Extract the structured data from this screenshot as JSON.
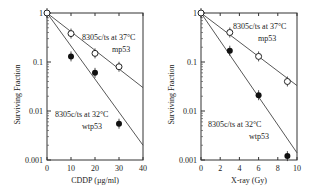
{
  "chart_data": [
    {
      "type": "scatter",
      "title": "",
      "xlabel": "CDDP (µg/ml)",
      "ylabel": "Surviving Fraction",
      "xlim": [
        0,
        40
      ],
      "ylim": [
        0.001,
        1
      ],
      "yscale": "log",
      "x_ticks": [
        "0",
        "10",
        "20",
        "30",
        "40"
      ],
      "y_ticks": [
        "1",
        "0.1",
        "0.01",
        "0.001"
      ],
      "grid": false,
      "annotations": [
        {
          "text": "8305c/ts at 37°C",
          "sub": "mp53"
        },
        {
          "text": "8305c/ts at 32°C",
          "sub": "wtp53"
        }
      ],
      "series": [
        {
          "name": "8305c/ts at 37°C mp53",
          "marker": "open-circle",
          "x": [
            0,
            10,
            20,
            30
          ],
          "y": [
            1,
            0.38,
            0.15,
            0.08
          ],
          "fit": [
            [
              0,
              1
            ],
            [
              40,
              0.03
            ]
          ]
        },
        {
          "name": "8305c/ts at 32°C wtp53",
          "marker": "filled-circle",
          "x": [
            10,
            20,
            30
          ],
          "y": [
            0.13,
            0.06,
            0.0055
          ],
          "fit": [
            [
              0,
              1
            ],
            [
              40,
              0.002
            ]
          ]
        }
      ]
    },
    {
      "type": "scatter",
      "title": "",
      "xlabel": "X-ray (Gy)",
      "ylabel": "Surviving Fraction",
      "xlim": [
        0,
        10
      ],
      "ylim": [
        0.001,
        1
      ],
      "yscale": "log",
      "x_ticks": [
        "0",
        "2",
        "4",
        "6",
        "8",
        "10"
      ],
      "y_ticks": [
        "1",
        "0.1",
        "0.01",
        "0.001"
      ],
      "grid": false,
      "annotations": [
        {
          "text": "8305c/ts at 37°C",
          "sub": "mp53"
        },
        {
          "text": "8305c/ts at 32°C",
          "sub": "wtp53"
        }
      ],
      "series": [
        {
          "name": "8305c/ts at 37°C mp53",
          "marker": "open-circle",
          "x": [
            0,
            3,
            6,
            9
          ],
          "y": [
            1,
            0.4,
            0.13,
            0.04
          ],
          "fit": [
            [
              0,
              1
            ],
            [
              10,
              0.033
            ]
          ]
        },
        {
          "name": "8305c/ts at 32°C wtp53",
          "marker": "filled-circle",
          "x": [
            3,
            6,
            9
          ],
          "y": [
            0.17,
            0.021,
            0.0012
          ],
          "fit": [
            [
              0,
              1
            ],
            [
              10,
              0.0014
            ]
          ]
        }
      ]
    }
  ]
}
